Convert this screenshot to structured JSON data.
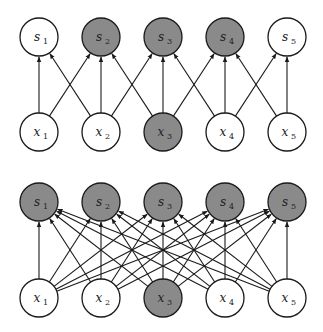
{
  "colors": {
    "shaded": "#8a8a8a",
    "unshaded": "#ffffff",
    "stroke": "#1a1a1a",
    "edge": "#1a1a1a"
  },
  "layout": {
    "node_x": [
      39,
      101,
      163,
      225,
      287
    ],
    "radius": 19
  },
  "diagrams": [
    {
      "name": "sparse-connectivity",
      "output_row_y": 37,
      "input_row_y": 132,
      "outputs": [
        {
          "var": "s",
          "sub": "1",
          "shaded": false
        },
        {
          "var": "s",
          "sub": "2",
          "shaded": true
        },
        {
          "var": "s",
          "sub": "3",
          "shaded": true
        },
        {
          "var": "s",
          "sub": "4",
          "shaded": true
        },
        {
          "var": "s",
          "sub": "5",
          "shaded": false
        }
      ],
      "inputs": [
        {
          "var": "x",
          "sub": "1",
          "shaded": false
        },
        {
          "var": "x",
          "sub": "2",
          "shaded": false
        },
        {
          "var": "x",
          "sub": "3",
          "shaded": true
        },
        {
          "var": "x",
          "sub": "4",
          "shaded": false
        },
        {
          "var": "x",
          "sub": "5",
          "shaded": false
        }
      ],
      "connectivity": "kernel3"
    },
    {
      "name": "dense-connectivity",
      "output_row_y": 202,
      "input_row_y": 298,
      "outputs": [
        {
          "var": "s",
          "sub": "1",
          "shaded": true
        },
        {
          "var": "s",
          "sub": "2",
          "shaded": true
        },
        {
          "var": "s",
          "sub": "3",
          "shaded": true
        },
        {
          "var": "s",
          "sub": "4",
          "shaded": true
        },
        {
          "var": "s",
          "sub": "5",
          "shaded": true
        }
      ],
      "inputs": [
        {
          "var": "x",
          "sub": "1",
          "shaded": false
        },
        {
          "var": "x",
          "sub": "2",
          "shaded": false
        },
        {
          "var": "x",
          "sub": "3",
          "shaded": true
        },
        {
          "var": "x",
          "sub": "4",
          "shaded": false
        },
        {
          "var": "x",
          "sub": "5",
          "shaded": false
        }
      ],
      "connectivity": "full"
    }
  ]
}
